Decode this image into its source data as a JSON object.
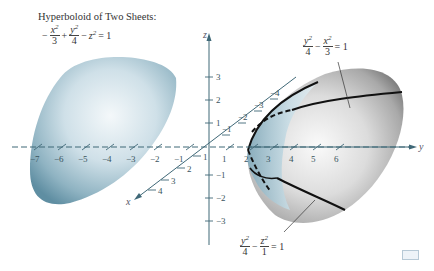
{
  "figure": {
    "title": "Hyperboloid of Two Sheets:",
    "main_equation": {
      "sign1": "−",
      "term1_num": "x",
      "term1_den": "3",
      "op1": "+",
      "term2_num": "y",
      "term2_den": "4",
      "op2": "−",
      "term3": "z",
      "rhs": "= 1"
    },
    "trace_top": {
      "num1": "y",
      "den1": "4",
      "op": "−",
      "num2": "x",
      "den2": "3",
      "rhs": "= 1"
    },
    "trace_bottom": {
      "num1": "y",
      "den1": "4",
      "op": "−",
      "num2": "z",
      "den2": "1",
      "rhs": "= 1"
    },
    "axes": {
      "x_label": "x",
      "y_label": "y",
      "z_label": "z",
      "y_ticks_negative": [
        "−7",
        "−6",
        "−5",
        "−4",
        "−3",
        "−2",
        "−1"
      ],
      "y_ticks_positive": [
        "1",
        "2",
        "3",
        "4",
        "5",
        "6"
      ],
      "z_ticks_positive": [
        "3",
        "2",
        "1"
      ],
      "z_ticks_negative": [
        "−1",
        "−2",
        "−3"
      ],
      "x_ticks_positive": [
        "1",
        "2",
        "3",
        "4"
      ],
      "x_ticks_negative": [
        "−1",
        "−2",
        "−3",
        "−4"
      ]
    },
    "colors": {
      "left_sheet": "#8fb3c2",
      "right_sheet_outer": "#9a9a9a",
      "right_sheet_inner": "#a9cbd8",
      "axis": "#3f6877"
    }
  }
}
